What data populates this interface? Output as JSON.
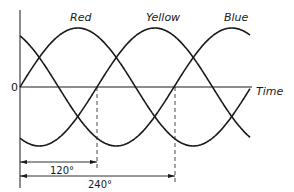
{
  "diagram": {
    "origin_label": "0",
    "time_axis_label": "Time",
    "phases": [
      {
        "name": "Red",
        "phase_deg": 0
      },
      {
        "name": "Yellow",
        "phase_deg": 120
      },
      {
        "name": "Blue",
        "phase_deg": 240
      }
    ],
    "dimensions": [
      {
        "label": "120°",
        "from_deg": 0,
        "to_deg": 120
      },
      {
        "label": "240°",
        "from_deg": 0,
        "to_deg": 240
      }
    ],
    "colors": {
      "line": "#1a1a1a",
      "background": "#ffffff"
    }
  }
}
